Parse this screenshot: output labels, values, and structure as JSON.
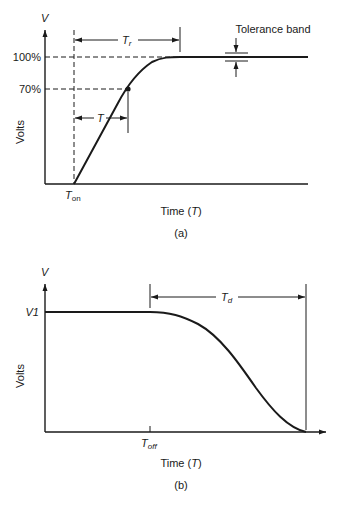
{
  "figure_a": {
    "caption": "(a)",
    "y_axis_symbol": "V",
    "y_axis_label": "Volts",
    "x_axis_label_prefix": "Time (",
    "x_axis_label_var": "T",
    "x_axis_label_suffix": ")",
    "level_100": "100%",
    "level_70": "70%",
    "t_on_main": "T",
    "t_on_sub": "on",
    "rise_time_main": "T",
    "rise_time_sub": "r",
    "time_constant": "T",
    "tolerance_label": "Tolerance band"
  },
  "figure_b": {
    "caption": "(b)",
    "y_axis_symbol": "V",
    "y_axis_label": "Volts",
    "x_axis_label_prefix": "Time (",
    "x_axis_label_var": "T",
    "x_axis_label_suffix": ")",
    "level_v1": "V1",
    "t_off_main": "T",
    "t_off_sub": "off",
    "delay_main": "T",
    "delay_sub": "d"
  },
  "colors": {
    "ink": "#1a1a1a",
    "background": "#ffffff"
  }
}
